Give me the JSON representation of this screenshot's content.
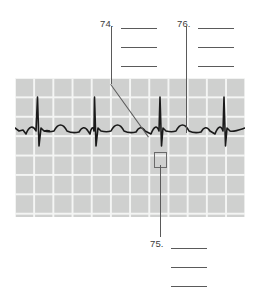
{
  "figure": {
    "kind": "ecg-labeling-exercise",
    "ink_color": "#5a5a5a",
    "text_color": "#3b3b3b",
    "grid_cell_color": "#cfd0cf",
    "grid_line_color": "#f4f5f4",
    "trace_color": "#1a1a1a"
  },
  "callouts": [
    {
      "id": "callout-74",
      "number": "74.",
      "number_x": 100,
      "number_y": 19,
      "blank_lines": [
        {
          "x": 121,
          "y": 28,
          "width": 36
        },
        {
          "x": 121,
          "y": 47,
          "width": 36
        },
        {
          "x": 121,
          "y": 66,
          "width": 36
        }
      ],
      "leader": {
        "type": "vertical-then-diagonal",
        "v_x": 111,
        "v_y_top": 26,
        "v_y_bottom": 84,
        "diag_x1": 111,
        "diag_y1": 84,
        "diag_x2": 149,
        "diag_y2": 137
      }
    },
    {
      "id": "callout-76",
      "number": "76.",
      "number_x": 177,
      "number_y": 19,
      "blank_lines": [
        {
          "x": 198,
          "y": 28,
          "width": 36
        },
        {
          "x": 198,
          "y": 47,
          "width": 36
        },
        {
          "x": 198,
          "y": 66,
          "width": 36
        }
      ],
      "leader": {
        "type": "vertical",
        "v_x": 186,
        "v_y_top": 26,
        "v_y_bottom": 133
      }
    },
    {
      "id": "callout-75",
      "number": "75.",
      "number_x": 150,
      "number_y": 239,
      "blank_lines": [
        {
          "x": 171,
          "y": 248,
          "width": 36
        },
        {
          "x": 171,
          "y": 267,
          "width": 36
        },
        {
          "x": 171,
          "y": 286,
          "width": 36
        }
      ],
      "leader": {
        "type": "vertical",
        "v_x": 160,
        "v_y_top": 165,
        "v_y_bottom": 237
      }
    }
  ],
  "ecg_strip": {
    "x": 15,
    "y": 78,
    "width": 230,
    "height": 139,
    "grid_cell_w": 19.2,
    "grid_cell_h": 19.4,
    "baseline_y": 53,
    "beats": [
      {
        "r_x": 22,
        "r_peak_y": 19,
        "s_y": 68
      },
      {
        "r_x": 78,
        "r_peak_y": 19,
        "s_y": 68
      },
      {
        "r_x": 143,
        "r_peak_y": 19,
        "s_y": 68
      },
      {
        "r_x": 207,
        "r_peak_y": 19,
        "s_y": 68
      }
    ],
    "marker_box": {
      "x": 139,
      "y": 74,
      "width": 11,
      "height": 14
    }
  },
  "chart_data": {
    "type": "line",
    "xlabel": "",
    "ylabel": "",
    "grid": true,
    "legend": "none",
    "series": [
      {
        "name": "ECG waveform",
        "description": "Four normal sinus beats with P wave, QRS complex, T wave and U wave"
      }
    ],
    "annotations": [
      {
        "label": "74.",
        "points_to": "QRS complex / S wave region of third beat"
      },
      {
        "label": "75.",
        "points_to": "marked interval box below third QRS complex"
      },
      {
        "label": "76.",
        "points_to": "T wave following third QRS complex"
      }
    ]
  }
}
